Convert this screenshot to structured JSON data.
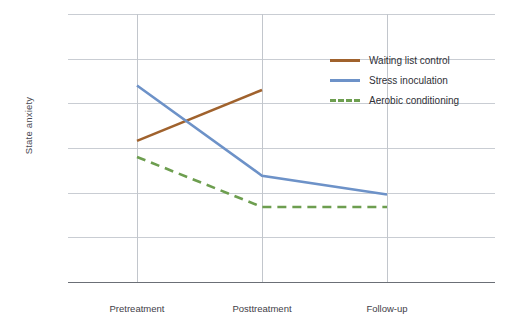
{
  "chart_data": {
    "type": "line",
    "title": "",
    "xlabel": "",
    "ylabel": "State anxiety",
    "categories": [
      "Pretreatment",
      "Posttreatment",
      "Follow-up"
    ],
    "ylim": [
      25,
      55
    ],
    "yticks": [
      25,
      30,
      35,
      40,
      45,
      50,
      55
    ],
    "grid": "horizontal-and-vertical",
    "legend_position": "upper-right-inside",
    "series": [
      {
        "name": "Waiting list control",
        "color": "#a0622d",
        "style": "solid",
        "values": [
          40.8,
          46.5,
          null
        ]
      },
      {
        "name": "Stress inoculation",
        "color": "#6d92c8",
        "style": "solid",
        "values": [
          47.0,
          36.9,
          34.8
        ]
      },
      {
        "name": "Aerobic conditioning",
        "color": "#6d9e4f",
        "style": "dashed",
        "values": [
          39.0,
          33.4,
          33.4
        ]
      }
    ]
  },
  "axis": {
    "y_label": "State anxiety",
    "y_ticks": [
      "55",
      "50",
      "45",
      "40",
      "35",
      "30",
      "25"
    ],
    "x_ticks": [
      "Pretreatment",
      "Posttreatment",
      "Follow-up"
    ]
  },
  "legend": {
    "items": [
      {
        "label": "Waiting list control",
        "color": "#a0622d",
        "style": "solid"
      },
      {
        "label": "Stress inoculation",
        "color": "#6d92c8",
        "style": "solid"
      },
      {
        "label": "Aerobic conditioning",
        "color": "#6d9e4f",
        "style": "dashed"
      }
    ]
  }
}
